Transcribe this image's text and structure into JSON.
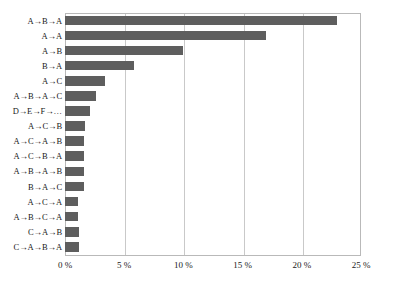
{
  "chart_data": {
    "type": "bar",
    "orientation": "horizontal",
    "title": "",
    "subtitle": "",
    "xlabel": "",
    "ylabel": "",
    "xlim": [
      0,
      25
    ],
    "xunit": "%",
    "grid": true,
    "legend": false,
    "bar_color": "#5e5e5e",
    "grid_color": "#c9c9c9",
    "frame_color": "#b9b9b9",
    "background": "#ffffff",
    "categories": [
      "A→B→A",
      "A→A",
      "A→B",
      "B→A",
      "A→C",
      "A→B→A→C",
      "D→E→F→…",
      "A→C→B",
      "A→C→A→B",
      "A→C→B→A",
      "A→B→A→B",
      "B→A→C",
      "A→C→A",
      "A→B→C→A",
      "C→A→B",
      "C→A→B→A"
    ],
    "values": [
      23.0,
      17.0,
      10.0,
      5.8,
      3.4,
      2.6,
      2.1,
      1.7,
      1.6,
      1.6,
      1.6,
      1.6,
      1.1,
      1.1,
      1.2,
      1.2
    ],
    "xticks": [
      0,
      5,
      10,
      15,
      20,
      25
    ],
    "xticklabels": [
      "0 %",
      "5 %",
      "10 %",
      "15 %",
      "20 %",
      "25 %"
    ]
  }
}
